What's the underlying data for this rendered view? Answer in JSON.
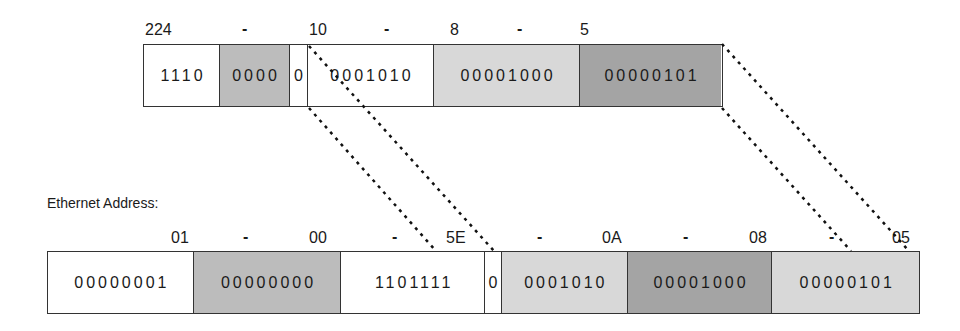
{
  "ip_address": {
    "octet_labels": [
      "224",
      "10",
      "8",
      "5"
    ],
    "separator": "-",
    "segments": [
      {
        "bits": "1110",
        "shade": "white"
      },
      {
        "bits": "0000",
        "shade": "gray"
      },
      {
        "bits": "0",
        "shade": "white"
      },
      {
        "bits": "0001010",
        "shade": "white"
      },
      {
        "bits": "00001000",
        "shade": "light"
      },
      {
        "bits": "00000101",
        "shade": "dark"
      }
    ]
  },
  "ethernet_address": {
    "caption": "Ethernet Address:",
    "octet_labels": [
      "01",
      "00",
      "5E",
      "0A",
      "08",
      "05"
    ],
    "separator": "-",
    "segments": [
      {
        "bits": "00000001",
        "shade": "white"
      },
      {
        "bits": "00000000",
        "shade": "gray"
      },
      {
        "bits": "1101111",
        "shade": "white"
      },
      {
        "bits": "0",
        "shade": "white"
      },
      {
        "bits": "0001010",
        "shade": "light"
      },
      {
        "bits": "00001000",
        "shade": "dark"
      },
      {
        "bits": "00000101",
        "shade": "light"
      }
    ]
  },
  "colors": {
    "white": "#ffffff",
    "gray": "#bcbcbc",
    "light": "#d8d8d8",
    "dark": "#a4a4a4",
    "line": "#111111"
  }
}
